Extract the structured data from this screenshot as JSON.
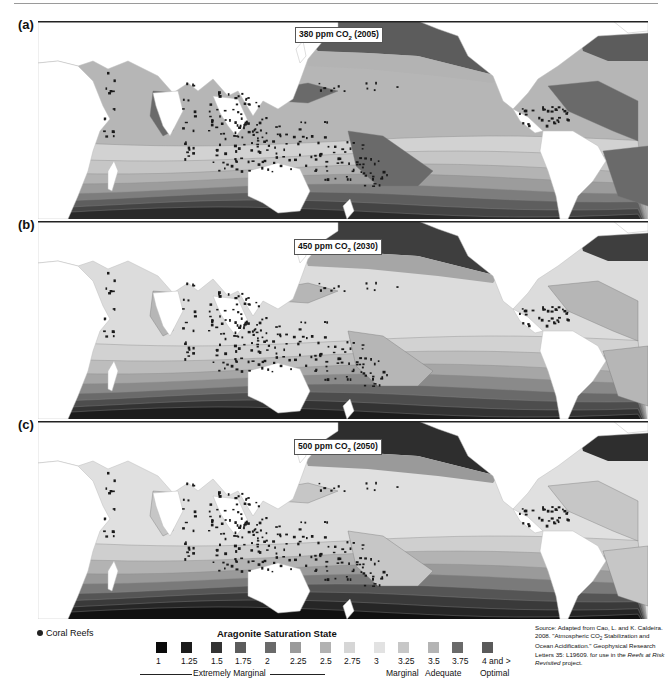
{
  "figure": {
    "panels": [
      {
        "id": "a",
        "label": "(a)",
        "co2_text": "380 ppm CO",
        "co2_sub": "2",
        "co2_year": " (2005)",
        "top": 21
      },
      {
        "id": "b",
        "label": "(b)",
        "co2_text": "450 ppm CO",
        "co2_sub": "2",
        "co2_year": " (2030)",
        "top": 221
      },
      {
        "id": "c",
        "label": "(c)",
        "co2_text": "500 ppm CO",
        "co2_sub": "2",
        "co2_year": " (2050)",
        "top": 421
      }
    ]
  },
  "legend": {
    "reef_label": "Coral Reefs",
    "reef_icon": "circle-dot-icon",
    "title": "Aragonite Saturation State",
    "items": [
      {
        "value": "1",
        "color": "#0a0a0a",
        "x": 156
      },
      {
        "value": "1.25",
        "color": "#1c1c1c",
        "x": 181
      },
      {
        "value": "1.5",
        "color": "#333333",
        "x": 211
      },
      {
        "value": "1.75",
        "color": "#5c5c5c",
        "x": 235
      },
      {
        "value": "2",
        "color": "#6a6a6a",
        "x": 265
      },
      {
        "value": "2.25",
        "color": "#9a9a9a",
        "x": 290
      },
      {
        "value": "2.5",
        "color": "#b2b2b2",
        "x": 320
      },
      {
        "value": "2.75",
        "color": "#d6d6d6",
        "x": 344
      },
      {
        "value": "3",
        "color": "#e2e2e2",
        "x": 374
      },
      {
        "value": "3.25",
        "color": "#c7c7c7",
        "x": 398
      },
      {
        "value": "3.5",
        "color": "#b4b4b4",
        "x": 428
      },
      {
        "value": "3.75",
        "color": "#6a6a6a",
        "x": 452
      },
      {
        "value": "4 and >",
        "color": "#5a5a5a",
        "x": 482
      }
    ],
    "categories": [
      {
        "label": "Extremely Marginal",
        "x": 193
      },
      {
        "label": "Marginal",
        "x": 386
      },
      {
        "label": "Adequate",
        "x": 425
      },
      {
        "label": "Optimal",
        "x": 480
      }
    ],
    "source": {
      "line1": "Source: Adapted from Cao, L. and K. Caldeira. 2008. \"Atmospheric CO",
      "sub": "2",
      "line2": " Stabilization and Ocean Acidification.\" Geophysical Research Letters 35: L19609. for use in the ",
      "italic": "Reefs at Risk Revisited",
      "line3": " project."
    }
  },
  "chart_data": {
    "type": "map",
    "panels": [
      {
        "label": "(a)",
        "scenario": "380 ppm CO2 (2005)",
        "tropical_state": "mostly 3.5–4 and > (adequate/optimal)"
      },
      {
        "label": "(b)",
        "scenario": "450 ppm CO2 (2030)",
        "tropical_state": "mostly 3–3.5 (marginal/adequate)"
      },
      {
        "label": "(c)",
        "scenario": "500 ppm CO2 (2050)",
        "tropical_state": "mostly 2.75–3.25 (marginal)"
      }
    ],
    "legend_scale": [
      "1",
      "1.25",
      "1.5",
      "1.75",
      "2",
      "2.25",
      "2.5",
      "2.75",
      "3",
      "3.25",
      "3.5",
      "3.75",
      "4 and >"
    ],
    "legend_categories": [
      "Extremely Marginal",
      "Marginal",
      "Adequate",
      "Optimal"
    ],
    "point_layer": "Coral Reefs"
  },
  "maps": {
    "a": {
      "bands": [
        "#2a2a2a",
        "#444",
        "#5e5e5e",
        "#7d7d7d",
        "#9c9c9c",
        "#b3b3b3",
        "#c6c6c6",
        "#d2d2d2",
        "#b6b6b6"
      ],
      "ocean": "#b6b6b6",
      "hot": "#6a6a6a",
      "north": "#5c5c5c"
    },
    "b": {
      "bands": [
        "#1c1c1c",
        "#333",
        "#4d4d4d",
        "#6a6a6a",
        "#8a8a8a",
        "#a6a6a6",
        "#bdbdbd",
        "#d2d2d2",
        "#e0e0e0"
      ],
      "ocean": "#dcdcdc",
      "hot": "#b6b6b6",
      "north": "#3e3e3e"
    },
    "c": {
      "bands": [
        "#111",
        "#262626",
        "#3a3a3a",
        "#555",
        "#7a7a7a",
        "#9a9a9a",
        "#b3b3b3",
        "#cfcfcf",
        "#e3e3e3"
      ],
      "ocean": "#e0e0e0",
      "hot": "#c6c6c6",
      "north": "#2e2e2e"
    }
  }
}
